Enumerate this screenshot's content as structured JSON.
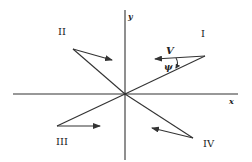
{
  "diagram": {
    "axes": {
      "x_label": "x",
      "y_label": "y"
    },
    "quadrants": [
      {
        "id": "I",
        "label": "I"
      },
      {
        "id": "II",
        "label": "II"
      },
      {
        "id": "III",
        "label": "III"
      },
      {
        "id": "IV",
        "label": "IV"
      }
    ],
    "vector_label": "V",
    "angle_label": "ψ",
    "colors": {
      "line": "#333333",
      "text": "#222222",
      "background": "#ffffff"
    }
  }
}
